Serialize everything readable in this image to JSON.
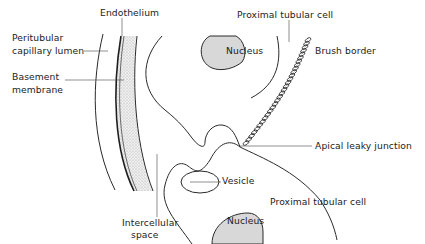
{
  "diagram": {
    "type": "anatomical schematic",
    "labels": {
      "endothelium": "Endothelium",
      "peritubular_line1": "Peritubular",
      "peritubular_line2": "capillary lumen",
      "basement_line1": "Basement",
      "basement_line2": "membrane",
      "proximal_top": "Proximal tubular cell",
      "nucleus_top": "Nucleus",
      "brush_border": "Brush border",
      "apical_junction": "Apical leaky junction",
      "vesicle": "Vesicle",
      "proximal_bottom": "Proximal tubular cell",
      "intercellular_line1": "Intercellular",
      "intercellular_line2": "space",
      "nucleus_bottom": "Nucleus"
    },
    "colors": {
      "line": "#2a2a2a",
      "stipple": "#cfcfcf",
      "nucleus_fill": "#d8d8d8",
      "background": "#ffffff"
    }
  }
}
